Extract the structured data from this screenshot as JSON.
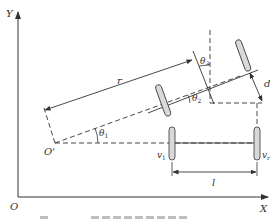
{
  "figure": {
    "axes": {
      "x_label": "X",
      "y_label": "Y",
      "origin_label": "O"
    },
    "points": {
      "icr_label": "O'"
    },
    "labels": {
      "radius": "r",
      "angle_1": "θ",
      "angle_1_sub": "1",
      "angle_2": "θ",
      "angle_2_sub": "2",
      "angle_3": "θ",
      "angle_3_sub": "3",
      "offset": "d",
      "track": "l",
      "wheel_left": "v",
      "wheel_left_sub": "1",
      "wheel_right": "v",
      "wheel_right_sub": "r"
    },
    "colors": {
      "line": "#333333",
      "wheel_fill": "#d9d9d9",
      "background": "#ffffff"
    },
    "caption_visible": "partially cut off"
  }
}
